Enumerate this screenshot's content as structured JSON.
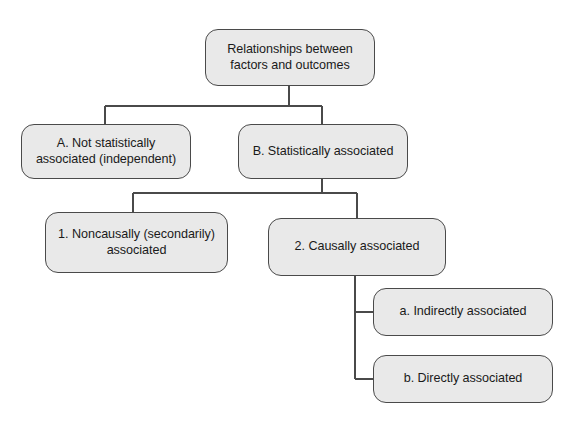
{
  "diagram": {
    "type": "hierarchy-tree",
    "title_node": "Relationships between factors and outcomes",
    "palette": {
      "background": "#ffffff",
      "node_fill": "#e9e9e9",
      "node_border": "#4a4a4a",
      "connector": "#4a4a4a",
      "text": "#1a1a1a"
    },
    "nodes": {
      "root": {
        "label": "Relationships between\nfactors and outcomes",
        "level": 0
      },
      "a": {
        "label": "A. Not statistically\nassociated (independent)",
        "level": 1
      },
      "b": {
        "label": "B. Statistically associated",
        "level": 1
      },
      "b1": {
        "label": "1. Noncausally (secondarily)\nassociated",
        "level": 2
      },
      "b2": {
        "label": "2. Causally associated",
        "level": 2
      },
      "b2a": {
        "label": "a. Indirectly associated",
        "level": 3
      },
      "b2b": {
        "label": "b. Directly associated",
        "level": 3
      }
    },
    "edges": [
      {
        "from": "root",
        "to": "a",
        "style": "elbow"
      },
      {
        "from": "root",
        "to": "b",
        "style": "elbow"
      },
      {
        "from": "b",
        "to": "b1",
        "style": "elbow"
      },
      {
        "from": "b",
        "to": "b2",
        "style": "elbow"
      },
      {
        "from": "b2",
        "to": "b2a",
        "style": "elbow-side"
      },
      {
        "from": "b2",
        "to": "b2b",
        "style": "elbow-side"
      }
    ]
  }
}
